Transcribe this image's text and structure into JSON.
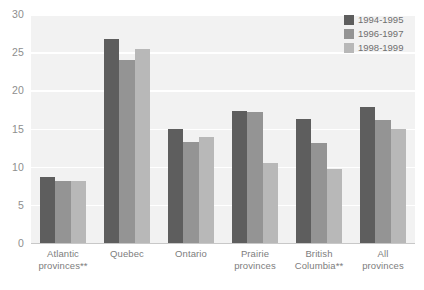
{
  "chart_data": {
    "type": "bar",
    "title": "",
    "subtitle": "",
    "xlabel": "",
    "ylabel": "",
    "ylim": [
      0,
      30
    ],
    "yticks": [
      0,
      5,
      10,
      15,
      20,
      25,
      30
    ],
    "ytick_labels": [
      "0",
      "5",
      "10",
      "15",
      "20",
      "25",
      "30"
    ],
    "grid": true,
    "legend_position": "top-right",
    "categories": [
      "Atlantic provinces**",
      "Quebec",
      "Ontario",
      "Prairie provinces",
      "British Columbia**",
      "All provinces"
    ],
    "category_lines": [
      [
        "Atlantic",
        "provinces**"
      ],
      [
        "Quebec"
      ],
      [
        "Ontario"
      ],
      [
        "Prairie",
        "provinces"
      ],
      [
        "British",
        "Columbia**"
      ],
      [
        "All",
        "provinces"
      ]
    ],
    "series": [
      {
        "name": "1994-1995",
        "color": "#5e5e5e",
        "values": [
          8.6,
          26.7,
          14.9,
          17.3,
          16.3,
          17.8
        ]
      },
      {
        "name": "1996-1997",
        "color": "#949494",
        "values": [
          8.1,
          24.0,
          13.2,
          17.1,
          13.1,
          16.1
        ]
      },
      {
        "name": "1998-1999",
        "color": "#b8b8b8",
        "values": [
          8.1,
          25.4,
          13.9,
          10.5,
          9.7,
          15.0
        ]
      }
    ]
  },
  "legend": {
    "items": [
      {
        "label": "1994-1995",
        "color": "#5e5e5e"
      },
      {
        "label": "1996-1997",
        "color": "#949494"
      },
      {
        "label": "1998-1999",
        "color": "#b8b8b8"
      }
    ]
  },
  "colors": {
    "plot_background": "#f2f2f2",
    "gridline": "#ffffff",
    "tick_text": "#8e8e8e",
    "category_text": "#7d7d7d",
    "legend_text": "#6f6f6f",
    "baseline": "#c8c8c8"
  }
}
